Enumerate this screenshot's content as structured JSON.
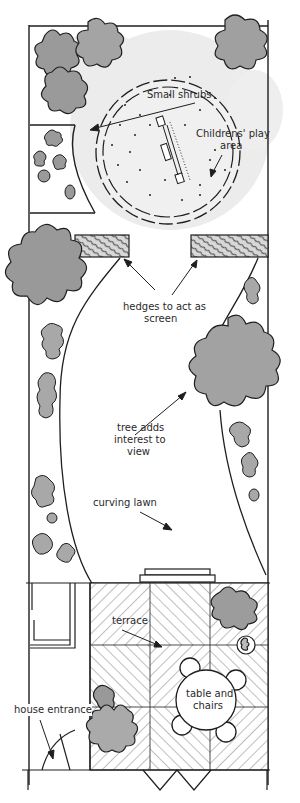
{
  "diagram": {
    "colors": {
      "ink": "#1e1e1e",
      "foliage": "#9a9a9a",
      "foliage_light": "#bdbdbd",
      "wash": "#e6e6e6",
      "background": "#ffffff"
    },
    "labels": {
      "small_shrubs": "Small shrubs",
      "childrens_play_line1": "Childrens' play",
      "childrens_play_line2": "area",
      "hedges_line1": "hedges to act as",
      "hedges_line2": "screen",
      "tree_line1": "tree adds",
      "tree_line2": "interest to",
      "tree_line3": "view",
      "curving_lawn": "curving lawn",
      "terrace": "terrace",
      "table_line1": "table and",
      "table_line2": "chairs",
      "house_entrance": "house entrance"
    }
  }
}
